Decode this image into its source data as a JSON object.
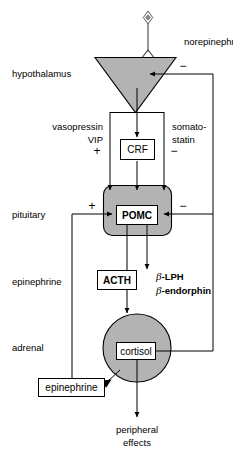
{
  "diagram": {
    "colors": {
      "organ_fill": "#b3b3b3",
      "stroke": "#000000",
      "background": "#ffffff"
    }
  },
  "nodes": {
    "norepinephrine": {
      "label": "norepinephrine",
      "icon": "neuron-terminal-icon"
    },
    "hypothalamus": {
      "label": "hypothalamus",
      "shape": "triangle"
    },
    "pituitary": {
      "label": "pituitary",
      "shape": "rounded-rect"
    },
    "adrenal": {
      "label": "adrenal",
      "shape": "circle"
    },
    "crf": {
      "label": "CRF"
    },
    "pomc": {
      "label": "POMC"
    },
    "acth": {
      "label": "ACTH"
    },
    "cortisol": {
      "label": "cortisol"
    },
    "epinephrine_box": {
      "label": "epinephrine"
    },
    "epinephrine_row": {
      "label": "epinephrine"
    }
  },
  "mediators": {
    "vasopressin": "vasopressin",
    "vip": "VIP",
    "somatostatin_line1": "somato-",
    "somatostatin_line2": "statin",
    "blph_symbol": "β",
    "blph_text": "-LPH",
    "bendorphin_symbol": "β",
    "bendorphin_text": "-endorphin"
  },
  "signs": {
    "plus_vasopressin": "+",
    "minus_somatostatin": "−",
    "minus_hypothalamus_feedback": "−",
    "plus_pituitary": "+",
    "minus_pituitary_feedback": "−"
  },
  "output": {
    "line1": "peripheral",
    "line2": "effects"
  }
}
